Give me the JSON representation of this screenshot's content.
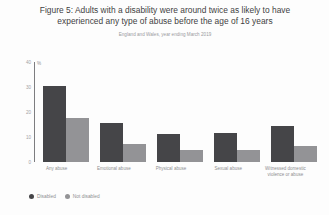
{
  "figure": {
    "title": "Figure 5: Adults with a disability were around twice as likely to have experienced any type of abuse before the age of 16 years",
    "subtitle": "England and Wales, year ending March 2019"
  },
  "legend": {
    "items": [
      {
        "label": "Disabled",
        "color": "#454548",
        "marker": "circle-marker"
      },
      {
        "label": "Not disabled",
        "color": "#939396",
        "marker": "circle-marker"
      }
    ]
  },
  "axis": {
    "unit_symbol": "%",
    "yticks": [
      "40",
      "30",
      "20",
      "10",
      "0"
    ]
  },
  "chart_data": {
    "type": "bar",
    "title": "Figure 5: Adults with a disability were around twice as likely to have experienced any type of abuse before the age of 16 years",
    "subtitle": "England and Wales, year ending March 2019",
    "xlabel": "",
    "ylabel": "%",
    "ylim": [
      0,
      40
    ],
    "yticks": [
      0,
      10,
      20,
      30,
      40
    ],
    "grid": false,
    "legend_position": "bottom-left",
    "categories": [
      "Any abuse",
      "Emotional abuse",
      "Physical abuse",
      "Sexual abuse",
      "Witnessed domestic violence or abuse"
    ],
    "series": [
      {
        "name": "Disabled",
        "color": "#454548",
        "values": [
          30.4,
          15.8,
          11.3,
          11.7,
          14.6
        ]
      },
      {
        "name": "Not disabled",
        "color": "#939396",
        "values": [
          17.5,
          7.1,
          5.0,
          5.0,
          6.3
        ]
      }
    ]
  }
}
